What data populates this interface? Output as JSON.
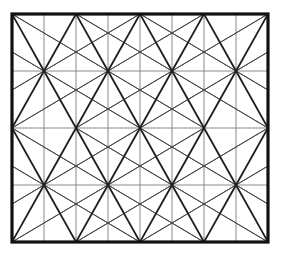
{
  "diagram": {
    "type": "geometric-line-pattern",
    "frame": {
      "x": 12,
      "y": 14,
      "width": 256,
      "height": 228
    },
    "grid": {
      "columns": 8,
      "rows": 4,
      "vertical_x": [
        12,
        44,
        76,
        108,
        140,
        172,
        204,
        236,
        268
      ],
      "horizontal_y": [
        14,
        71,
        128,
        185,
        242
      ]
    },
    "corner_points": {
      "x": [
        12,
        76,
        140,
        204,
        268
      ],
      "y": [
        14,
        128,
        242
      ]
    },
    "nodes": {
      "x": [
        44,
        108,
        172,
        236
      ],
      "y": [
        71,
        185
      ]
    },
    "colors": {
      "background": "#ffffff",
      "border": "#111111",
      "grid": "#8a8a8a",
      "thin_lines": "#4a4a4a",
      "thick_lines": "#1e1e1e"
    }
  }
}
